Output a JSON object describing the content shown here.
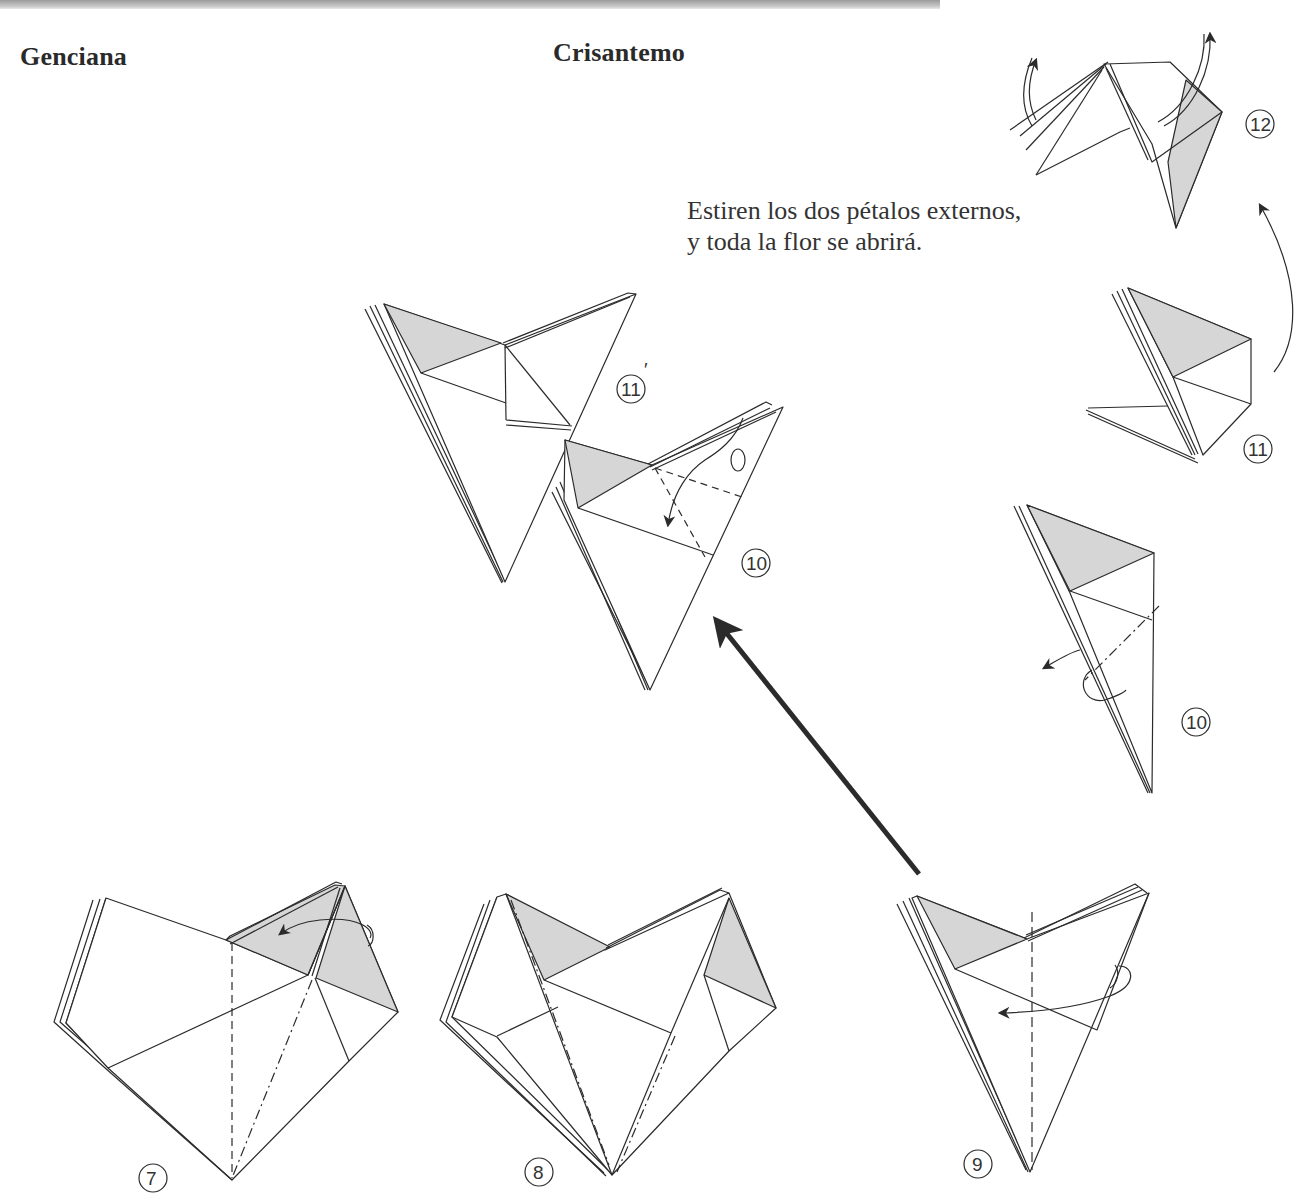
{
  "page": {
    "headings": {
      "left": "Genciana",
      "center": "Crisantemo"
    },
    "caption": {
      "line1": "Estiren los dos pétalos externos,",
      "line2": "y toda la flor se abrirá."
    },
    "colors": {
      "shade": "#d6d6d6",
      "line": "#2b2b2b",
      "paper": "#ffffff",
      "band": "#a8a8a8"
    }
  },
  "steps": {
    "s7": {
      "label": "7"
    },
    "s8": {
      "label": "8"
    },
    "s9": {
      "label": "9"
    },
    "s10_center": {
      "label": "10"
    },
    "s11_prime": {
      "label": "11",
      "mark": "′"
    },
    "s10_right": {
      "label": "10"
    },
    "s11_right": {
      "label": "11"
    },
    "s12": {
      "label": "12"
    }
  }
}
